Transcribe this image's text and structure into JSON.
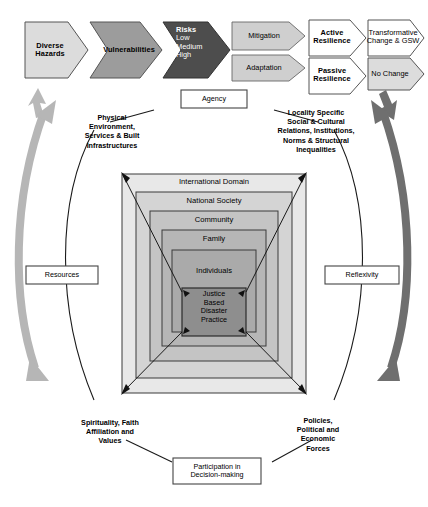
{
  "diagram": {
    "flow": {
      "stages": [
        {
          "id": "diverse-hazards",
          "label": "Diverse Hazards",
          "lines": [
            "Diverse",
            "Hazards"
          ],
          "fill": "#d9d9d9",
          "text": "#000000",
          "bold": true
        },
        {
          "id": "vulnerabilities",
          "label": "Vulnerabilities",
          "lines": [
            "Vulnerabilities"
          ],
          "fill": "#9a9a9a",
          "text": "#000000",
          "bold": true
        },
        {
          "id": "risks",
          "label": "Risks",
          "lines": [
            "Risks",
            "Low",
            "Medium",
            "High"
          ],
          "fill": "#4a4a4a",
          "text": "#ffffff",
          "bold": true
        },
        {
          "id": "mitigation",
          "label": "Mitigation",
          "lines": [
            "Mitigation"
          ],
          "fill": "#cfcfcf",
          "text": "#000000",
          "bold": false
        },
        {
          "id": "adaptation",
          "label": "Adaptation",
          "lines": [
            "Adaptation"
          ],
          "fill": "#cfcfcf",
          "text": "#000000",
          "bold": false
        },
        {
          "id": "active-resilience",
          "label": "Active Resilience",
          "lines": [
            "Active",
            "Resilience"
          ],
          "fill": "#ffffff",
          "text": "#000000",
          "bold": true
        },
        {
          "id": "passive-resilience",
          "label": "Passive Resilience",
          "lines": [
            "Passive",
            "Resilience"
          ],
          "fill": "#ffffff",
          "text": "#000000",
          "bold": true
        },
        {
          "id": "transformative-change",
          "label": "Transformative Change & GSW",
          "lines": [
            "Transformative",
            "Change & GSW"
          ],
          "fill": "#ffffff",
          "text": "#000000",
          "bold": false
        },
        {
          "id": "no-change",
          "label": "No Change",
          "lines": [
            "No Change"
          ],
          "fill": "#d9d9d9",
          "text": "#000000",
          "bold": false
        }
      ]
    },
    "cycle_nodes": {
      "agency": "Agency",
      "resources": "Resources",
      "reflexivity": "Reflexivity",
      "participation_line1": "Participation in",
      "participation_line2": "Decision-making"
    },
    "corners": {
      "top_left": [
        "Physical",
        "Environment,",
        "Services & Built",
        "Infrastructures"
      ],
      "top_right": [
        "Locality Specific",
        "Social & Cultural",
        "Relations, Institutions,",
        "Norms & Structural",
        "Inequalities"
      ],
      "bottom_left": [
        "Spirituality, Faith",
        "Affiliation and",
        "Values"
      ],
      "bottom_right": [
        "Policies,",
        "Political and",
        "Economic",
        "Forces"
      ]
    },
    "nested_levels": [
      {
        "id": "international-domain",
        "label": "International Domain",
        "fill": "#e6e6e6"
      },
      {
        "id": "national-society",
        "label": "National Society",
        "fill": "#d2d2d2"
      },
      {
        "id": "community",
        "label": "Community",
        "fill": "#c2c2c2"
      },
      {
        "id": "family",
        "label": "Family",
        "fill": "#b4b4b4"
      },
      {
        "id": "individuals",
        "label": "Individuals",
        "fill": "#a8a8a8"
      },
      {
        "id": "justice-based-disaster-practice",
        "label": "Justice Based Disaster Practice",
        "lines": [
          "Justice",
          "Based",
          "Disaster",
          "Practice"
        ],
        "fill": "#8e8e8e"
      }
    ],
    "colors": {
      "left_arc_arrow": "#b0b0b0",
      "right_arc_arrow": "#6e6e6e",
      "small_arrow_left": "#b5b5b5",
      "small_arrow_right": "#6e6e6e",
      "outline": "#3b3b3b"
    }
  }
}
